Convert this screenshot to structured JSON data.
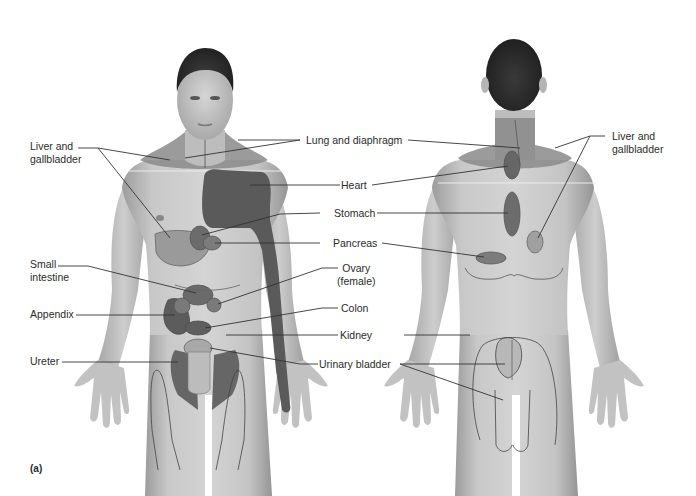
{
  "figure": {
    "panel_label": "(a)",
    "views": [
      "anterior",
      "posterior"
    ]
  },
  "colors": {
    "background": "#ffffff",
    "skin": "#c9c9c9",
    "skin_shadow": "#9e9e9e",
    "hair": "#2a2a2a",
    "region_dark": "#5a5a5a",
    "region_mid": "#7a7a7a",
    "region_light": "#9a9a9a",
    "leader_line": "#333333",
    "text": "#2b2b2b"
  },
  "labels": {
    "front_left": [
      {
        "id": "liver-gallbladder-front",
        "text": "Liver and\ngallbladder"
      },
      {
        "id": "small-intestine",
        "text": "Small\nintestine"
      },
      {
        "id": "appendix",
        "text": "Appendix"
      },
      {
        "id": "ureter",
        "text": "Ureter"
      }
    ],
    "center": [
      {
        "id": "lung-diaphragm",
        "text": "Lung and diaphragm"
      },
      {
        "id": "heart",
        "text": "Heart"
      },
      {
        "id": "stomach",
        "text": "Stomach"
      },
      {
        "id": "pancreas",
        "text": "Pancreas"
      },
      {
        "id": "ovary",
        "text": "Ovary\n(female)"
      },
      {
        "id": "colon",
        "text": "Colon"
      },
      {
        "id": "kidney",
        "text": "Kidney"
      },
      {
        "id": "urinary-bladder",
        "text": "Urinary bladder"
      }
    ],
    "back_right": [
      {
        "id": "liver-gallbladder-back",
        "text": "Liver and\ngallbladder"
      }
    ]
  }
}
